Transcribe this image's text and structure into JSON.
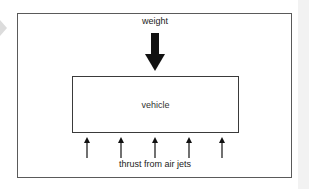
{
  "diagram": {
    "weight_label": "weight",
    "vehicle_label": "vehicle",
    "thrust_label": "thrust from air jets",
    "weight_arrow": {
      "direction": "down",
      "style": "thick-filled",
      "color": "#111111"
    },
    "thrust_arrows": {
      "count": 5,
      "direction": "up",
      "style": "thin",
      "color": "#111111",
      "x_positions": [
        87,
        121,
        155,
        189,
        222
      ]
    },
    "colors": {
      "frame": "#5a5a5a",
      "vehicle_box": "#3a3a3a",
      "text": "#222222",
      "background": "#ffffff"
    }
  }
}
